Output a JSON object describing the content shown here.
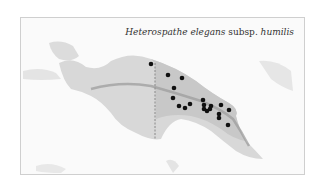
{
  "map": {
    "title_genus_species": "Heterospathe elegans",
    "title_rank": " subsp. ",
    "title_infraspecific": "humilis",
    "region": "New Guinea",
    "colors": {
      "land": "#dcdcdc",
      "range": "#c4c4c4",
      "mountains": "#9a9a9a",
      "dot": "#111111",
      "border": "#888888"
    },
    "points": [
      [
        150,
        63
      ],
      [
        167,
        74
      ],
      [
        181,
        77
      ],
      [
        173,
        87
      ],
      [
        172,
        97
      ],
      [
        178,
        105
      ],
      [
        184,
        107
      ],
      [
        189,
        103
      ],
      [
        202,
        99
      ],
      [
        203,
        104
      ],
      [
        203,
        108
      ],
      [
        206,
        110
      ],
      [
        209,
        108
      ],
      [
        210,
        105
      ],
      [
        220,
        104
      ],
      [
        228,
        109
      ],
      [
        218,
        113
      ],
      [
        218,
        117
      ],
      [
        227,
        124
      ]
    ]
  }
}
